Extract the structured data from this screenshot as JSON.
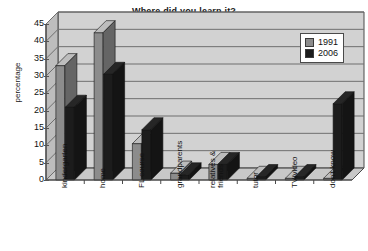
{
  "chart_data": {
    "type": "bar",
    "title": "Where did you learn it?",
    "xlabel": "",
    "ylabel": "percentage",
    "ylim": [
      0,
      45
    ],
    "ytick_step": 5,
    "yticks": [
      45,
      40,
      35,
      30,
      25,
      20,
      15,
      10,
      5,
      0
    ],
    "grid": true,
    "legend_position": "top-right",
    "style": "3d-clustered-column",
    "categories": [
      "kindergarten",
      "home",
      "FL course",
      "grandparents",
      "relatives & friends",
      "tutor",
      "TV/video",
      "don't know"
    ],
    "series": [
      {
        "name": "1991",
        "color": "#8c8c8c",
        "values": [
          33,
          42.5,
          10.5,
          2,
          4.5,
          0.5,
          0.5,
          0.5
        ]
      },
      {
        "name": "2006",
        "color": "#1c1c1c",
        "values": [
          21,
          30.5,
          14.5,
          1.5,
          4.5,
          1,
          1,
          22
        ]
      }
    ]
  },
  "legend": {
    "entries": [
      {
        "label": "1991",
        "swatch": "#8c8c8c"
      },
      {
        "label": "2006",
        "swatch": "#1c1c1c"
      }
    ]
  },
  "colors": {
    "plot_background": "#d2d2d2",
    "plot_wall_side": "#bdbdbd",
    "plot_floor": "#c8c8c8",
    "gridline": "#6f6f6f",
    "axis": "#4a4a4a",
    "series_1991": "#8c8c8c",
    "series_2006": "#1c1c1c",
    "text": "#111111",
    "page_background": "#ffffff"
  }
}
